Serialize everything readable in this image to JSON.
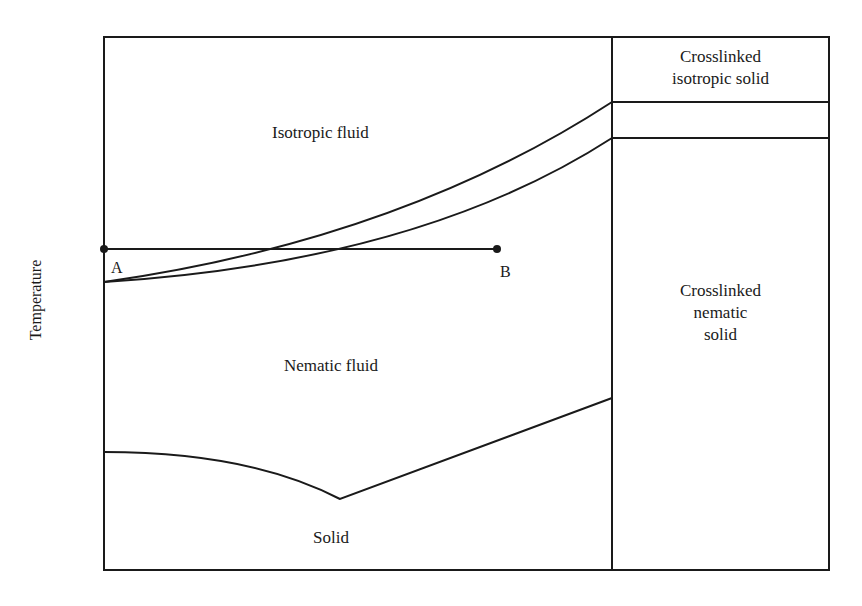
{
  "diagram": {
    "type": "phase-diagram",
    "ylabel": "Temperature",
    "regions": {
      "isotropic_fluid": "Isotropic fluid",
      "nematic_fluid": "Nematic fluid",
      "solid": "Solid",
      "crosslinked_isotropic": [
        "Crosslinked",
        "isotropic solid"
      ],
      "crosslinked_nematic": [
        "Crosslinked",
        "nematic",
        "solid"
      ]
    },
    "points": {
      "a": "A",
      "b": "B"
    },
    "line_color": "#1a1a1a"
  }
}
